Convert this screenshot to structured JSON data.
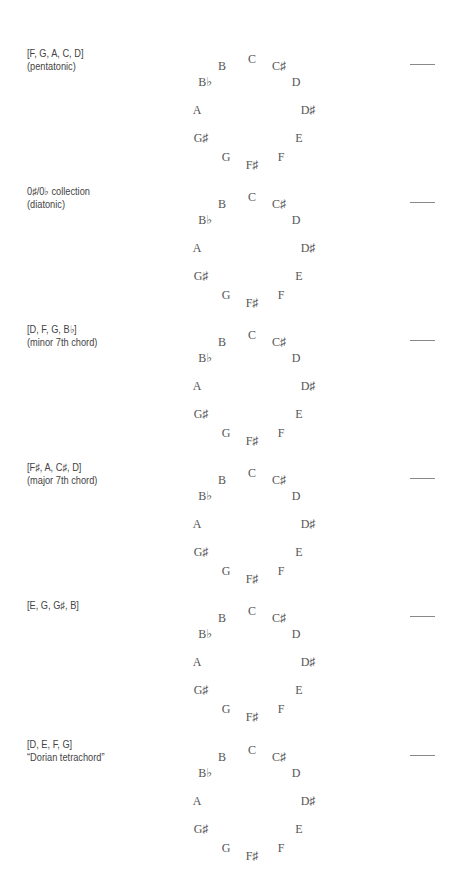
{
  "diagram": {
    "type": "pitch-class clock faces",
    "note_labels": [
      "C",
      "C♯",
      "D",
      "D♯",
      "E",
      "F",
      "F♯",
      "G",
      "G♯",
      "A",
      "B♭",
      "B"
    ],
    "rows": [
      {
        "set": "[F, G, A, C, D]",
        "description": "(pentatonic)",
        "dash": "—"
      },
      {
        "set": "0♯/0♭ collection",
        "description": "(diatonic)",
        "dash": "—"
      },
      {
        "set": "[D, F, G, B♭]",
        "description": "(minor 7th chord)",
        "dash": "—"
      },
      {
        "set": "[F♯, A, C♯, D]",
        "description": "(major 7th chord)",
        "dash": "—"
      },
      {
        "set": "[E, G, G♯, B]",
        "description": "",
        "dash": "—"
      },
      {
        "set": "[D, E, F, G]",
        "description": "“Dorian tetrachord”",
        "dash": "—"
      }
    ]
  }
}
